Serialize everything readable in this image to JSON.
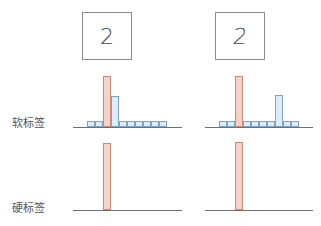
{
  "labels": {
    "soft": "软标签",
    "hard": "硬标签"
  },
  "digits": [
    "2",
    "2"
  ],
  "colors": {
    "true_class_fill": "#f6d3c6",
    "true_class_stroke": "#c88a7a",
    "other_class_fill": "#dcecf8",
    "other_class_stroke": "#7fa3c4",
    "axis": "#6f6f6f"
  },
  "chart_data": [
    {
      "type": "bar",
      "title": "Soft label (left sample, digit 2)",
      "categories": [
        "0",
        "1",
        "2",
        "3",
        "4",
        "5",
        "6",
        "7",
        "8",
        "9"
      ],
      "values": [
        0.12,
        0.12,
        1.0,
        0.6,
        0.12,
        0.12,
        0.12,
        0.12,
        0.12,
        0.12
      ],
      "highlight_index": 2,
      "ylabel": "",
      "xlabel": "",
      "grid": false
    },
    {
      "type": "bar",
      "title": "Soft label (right sample, digit 2)",
      "categories": [
        "0",
        "1",
        "2",
        "3",
        "4",
        "5",
        "6",
        "7",
        "8",
        "9"
      ],
      "values": [
        0.12,
        0.12,
        1.0,
        0.12,
        0.12,
        0.12,
        0.12,
        0.62,
        0.12,
        0.12
      ],
      "highlight_index": 2,
      "ylabel": "",
      "xlabel": "",
      "grid": false
    },
    {
      "type": "bar",
      "title": "Hard label (left sample)",
      "categories": [
        "0",
        "1",
        "2",
        "3",
        "4",
        "5",
        "6",
        "7",
        "8",
        "9"
      ],
      "values": [
        0,
        0,
        1,
        0,
        0,
        0,
        0,
        0,
        0,
        0
      ],
      "highlight_index": 2
    },
    {
      "type": "bar",
      "title": "Hard label (right sample)",
      "categories": [
        "0",
        "1",
        "2",
        "3",
        "4",
        "5",
        "6",
        "7",
        "8",
        "9"
      ],
      "values": [
        0,
        0,
        1,
        0,
        0,
        0,
        0,
        0,
        0,
        0
      ],
      "highlight_index": 2
    }
  ]
}
